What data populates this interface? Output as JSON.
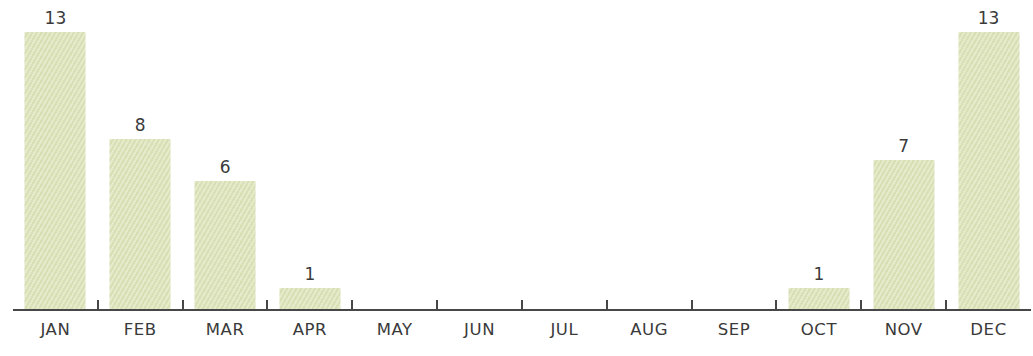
{
  "chart_data": {
    "type": "bar",
    "title": "",
    "xlabel": "",
    "ylabel": "",
    "categories": [
      "JAN",
      "FEB",
      "MAR",
      "APR",
      "MAY",
      "JUN",
      "JUL",
      "AUG",
      "SEP",
      "OCT",
      "NOV",
      "DEC"
    ],
    "values": [
      13,
      8,
      6,
      1,
      0,
      0,
      0,
      0,
      0,
      1,
      7,
      13
    ],
    "data_labels": [
      "13",
      "8",
      "6",
      "1",
      "",
      "",
      "",
      "",
      "",
      "1",
      "7",
      "13"
    ],
    "ylim": [
      0,
      14
    ],
    "grid": false,
    "legend": null,
    "x_tick_marks": "between-categories",
    "colors": {
      "bar_fill": "#dee5bd",
      "axis": "#474747",
      "text": "#3a3a3a",
      "background": "#ffffff"
    }
  }
}
